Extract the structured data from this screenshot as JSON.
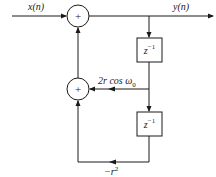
{
  "diagram": {
    "type": "signal-flow-graph",
    "colors": {
      "line": "#1a1a1a",
      "background": "#ffffff"
    },
    "input_label": "x(n)",
    "output_label": "y(n)",
    "adders": [
      {
        "id": "adder-top",
        "symbol": "+"
      },
      {
        "id": "adder-bottom",
        "symbol": "+"
      }
    ],
    "delays": [
      {
        "id": "delay-1",
        "label_base": "z",
        "label_exp": "−1"
      },
      {
        "id": "delay-2",
        "label_base": "z",
        "label_exp": "−1"
      }
    ],
    "gains": [
      {
        "id": "gain-1",
        "label_main": "2r cos ω",
        "label_sub": "0"
      },
      {
        "id": "gain-2",
        "label_main": "−r",
        "label_sup": "2"
      }
    ]
  }
}
